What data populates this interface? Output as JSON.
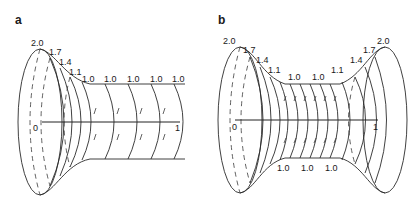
{
  "panels": [
    {
      "id": "a",
      "label": "a",
      "description": "Tube with flared left end, uniform radius 1.0 elsewhere",
      "axis": {
        "start_label": "0",
        "end_label": "1"
      },
      "radius_labels": [
        "2.0",
        "1.7",
        "1.4",
        "1.1",
        "1.0",
        "1.0",
        "1.0",
        "1.0",
        "1.0"
      ]
    },
    {
      "id": "b",
      "label": "b",
      "description": "Tube flared at both ends, narrow radius 1.0 in middle",
      "axis": {
        "start_label": "0",
        "end_label": "1"
      },
      "radius_labels_top": [
        "2.0",
        "1.7",
        "1.4",
        "1.1",
        "1.0",
        "1.0",
        "1.1",
        "1.4",
        "1.7",
        "2.0"
      ],
      "radius_labels_bottom": [
        "1.0",
        "1.0",
        "1.0"
      ]
    }
  ],
  "colors": {
    "line": "#2b2b2b",
    "background": "#ffffff"
  }
}
